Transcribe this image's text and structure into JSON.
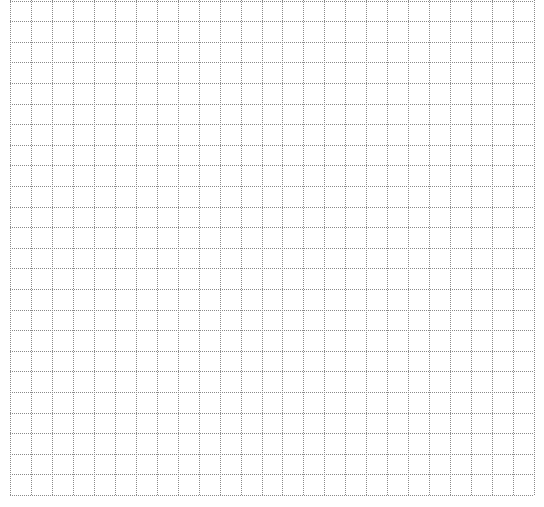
{
  "grid": {
    "left": 10,
    "right": 534,
    "top": 0,
    "bottom": 495,
    "columns": 25,
    "cell_height": 20.6,
    "line_color": "#8a8a8a",
    "background": "#ffffff"
  }
}
